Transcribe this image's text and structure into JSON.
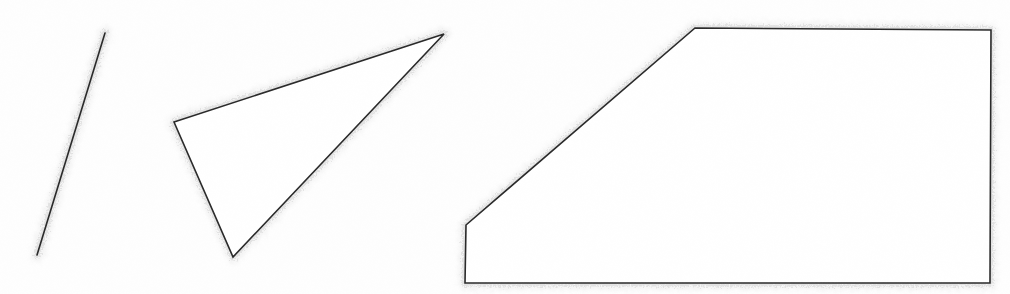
{
  "document": {
    "title": "Geometric line drawing",
    "kind": "scanned-line-art",
    "width": 1010,
    "height": 294,
    "background_color": "#fefefe",
    "stroke_color": "#262626",
    "halo_color": "#b9b9b9",
    "stroke_width": 1.6
  },
  "figures": [
    {
      "id": "figure-1",
      "name": "line-segment",
      "label": "Line segment",
      "type": "polyline",
      "closed": false,
      "vertex_count": 2,
      "points": [
        [
          37,
          255
        ],
        [
          105,
          33
        ]
      ],
      "points_path": "M 37 255 L 105 33"
    },
    {
      "id": "figure-2",
      "name": "triangle",
      "label": "Triangle",
      "type": "polygon",
      "closed": true,
      "vertex_count": 3,
      "points": [
        [
          174,
          122
        ],
        [
          444,
          34
        ],
        [
          233,
          257
        ]
      ],
      "points_path": "M 174 122 L 444 34 L 233 257 Z"
    },
    {
      "id": "figure-3",
      "name": "trapezoid-pentagon",
      "label": "Chamfered rectangle",
      "type": "polygon",
      "closed": true,
      "vertex_count": 5,
      "points": [
        [
          466,
          225
        ],
        [
          695,
          28
        ],
        [
          991,
          30
        ],
        [
          990,
          283
        ],
        [
          465,
          283
        ]
      ],
      "points_path": "M 466 225 L 695 28 L 991 30 L 990 283 L 465 283 Z"
    }
  ]
}
